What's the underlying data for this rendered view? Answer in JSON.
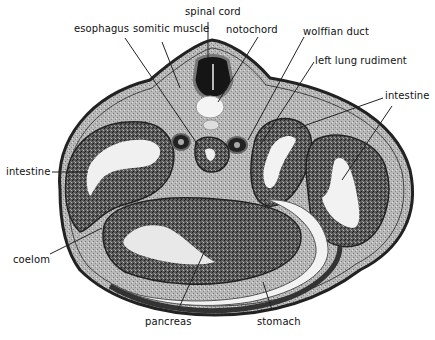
{
  "figure": {
    "labels": {
      "spinal_cord": "spinal cord",
      "esophagus": "esophagus",
      "somitic_muscle": "somitic muscle",
      "notochord": "notochord",
      "wolffian_duct": "wolffian duct",
      "left_lung_rudiment": "left lung rudiment",
      "intestine_right": "intestine",
      "intestine_left": "intestine",
      "coelom": "coelom",
      "pancreas": "pancreas",
      "stomach": "stomach"
    },
    "colors": {
      "background": "#ffffff",
      "tissue_dark": "#2a2a2a",
      "tissue_mid": "#7a7a7a",
      "tissue_light": "#c8c8c8",
      "lumen": "#f2f2f2",
      "leader_line": "#222222"
    }
  }
}
